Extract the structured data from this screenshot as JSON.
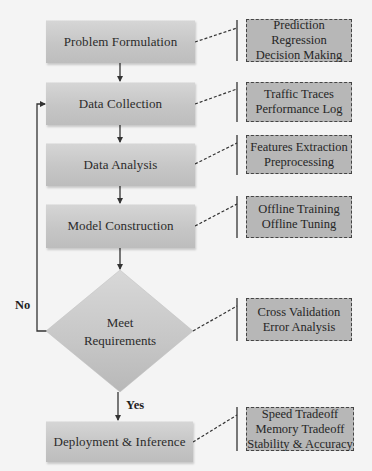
{
  "diagram": {
    "type": "flowchart",
    "colors": {
      "background": "#f4f4f4",
      "stage_fill": "#c8c8c8",
      "note_fill": "#b7b7b7",
      "note_border": "#444444",
      "line": "#333333"
    },
    "stages": [
      {
        "id": "problem-formulation",
        "label": "Problem Formulation"
      },
      {
        "id": "data-collection",
        "label": "Data Collection"
      },
      {
        "id": "data-analysis",
        "label": "Data Analysis"
      },
      {
        "id": "model-construction",
        "label": "Model Construction"
      },
      {
        "id": "deployment-inference",
        "label": "Deployment & Inference"
      }
    ],
    "decision": {
      "line1": "Meet",
      "line2": "Requirements",
      "yes_label": "Yes",
      "no_label": "No"
    },
    "notes": [
      {
        "for": "problem-formulation",
        "lines": [
          "Prediction",
          "Regression",
          "Decision Making"
        ]
      },
      {
        "for": "data-collection",
        "lines": [
          "Traffic Traces",
          "Performance Log"
        ]
      },
      {
        "for": "data-analysis",
        "lines": [
          "Features Extraction",
          "Preprocessing"
        ]
      },
      {
        "for": "model-construction",
        "lines": [
          "Offline Training",
          "Offline Tuning"
        ]
      },
      {
        "for": "decision",
        "lines": [
          "Cross Validation",
          "Error Analysis"
        ]
      },
      {
        "for": "deployment-inference",
        "lines": [
          "Speed Tradeoff",
          "Memory Tradeoff",
          "Stability & Accuracy"
        ]
      }
    ]
  }
}
